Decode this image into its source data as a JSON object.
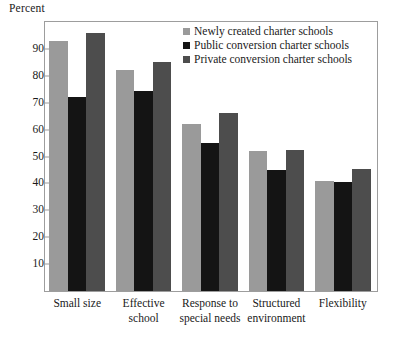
{
  "chart_data": {
    "type": "bar",
    "title": "",
    "xlabel": "",
    "ylabel": "Percent",
    "ylim": [
      0,
      100
    ],
    "yticks": [
      10,
      20,
      30,
      40,
      50,
      60,
      70,
      80,
      90
    ],
    "grid": false,
    "legend_position": "top-right",
    "categories": [
      "Small size",
      "Effective school",
      "Response to special needs",
      "Structured environment",
      "Flexibility"
    ],
    "category_lines": [
      [
        "Small size",
        ""
      ],
      [
        "Effective",
        "school"
      ],
      [
        "Response to",
        "special needs"
      ],
      [
        "Structured",
        "environment"
      ],
      [
        "Flexibility",
        ""
      ]
    ],
    "series": [
      {
        "name": "Newly created charter schools",
        "color": "#9a9a9a",
        "values": [
          93,
          82,
          62,
          52,
          41
        ]
      },
      {
        "name": "Public conversion charter schools",
        "color": "#141414",
        "values": [
          72,
          74.5,
          55,
          45,
          40.5
        ]
      },
      {
        "name": "Private conversion charter schools",
        "color": "#4d4d4d",
        "values": [
          96,
          85,
          66,
          52.5,
          45.5
        ]
      }
    ]
  },
  "axis": {
    "y_title": "Percent",
    "tick_labels": [
      "90",
      "80",
      "70",
      "60",
      "50",
      "40",
      "30",
      "20",
      "10"
    ]
  },
  "legend": {
    "items": [
      {
        "label": "Newly created charter schools",
        "color": "#9a9a9a"
      },
      {
        "label": "Public conversion charter schools",
        "color": "#141414"
      },
      {
        "label": "Private conversion charter schools",
        "color": "#4d4d4d"
      }
    ]
  },
  "colors": {
    "frame": "#9d9d9d",
    "background": "#ffffff",
    "text": "#1a1a1a"
  }
}
